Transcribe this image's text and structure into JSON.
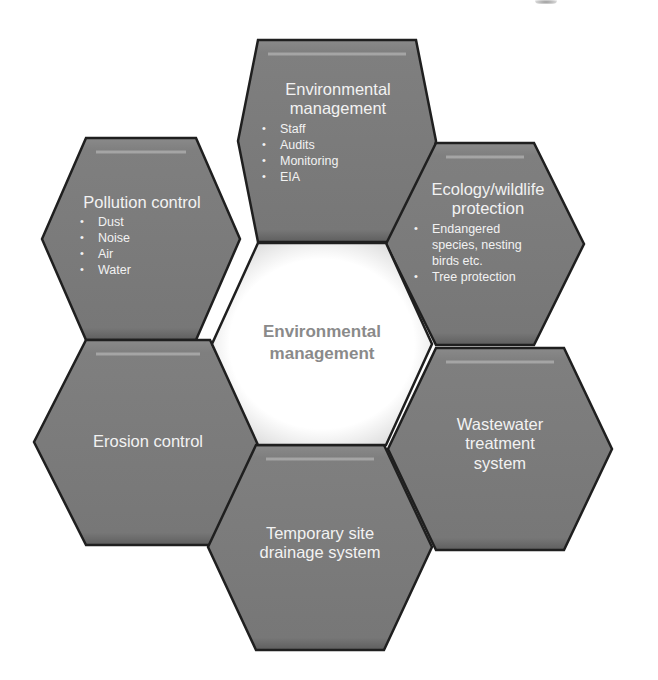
{
  "diagram": {
    "type": "hexagon-cluster",
    "colors": {
      "background": "#ffffff",
      "hex_fill": "#7d7d7d",
      "hex_border": "#1f1f1f",
      "hex_text": "#f2f2f2",
      "center_fill": "#ffffff",
      "center_text": "#8a8a8a"
    },
    "center": {
      "title_line1": "Environmental",
      "title_line2": "management"
    },
    "top": {
      "title_line1": "Environmental",
      "title_line2": "management",
      "items": [
        "Staff",
        "Audits",
        "Monitoring",
        "EIA"
      ]
    },
    "top_left": {
      "title": "Pollution control",
      "items": [
        "Dust",
        "Noise",
        "Air",
        "Water"
      ]
    },
    "top_right": {
      "title_line1": "Ecology/wildlife",
      "title_line2": "protection",
      "items": [
        "Endangered species, nesting birds etc.",
        "Tree protection"
      ]
    },
    "bottom_left": {
      "title": "Erosion control"
    },
    "bottom_right": {
      "title_line1": "Wastewater",
      "title_line2": "treatment",
      "title_line3": "system"
    },
    "bottom": {
      "title_line1": "Temporary site",
      "title_line2": "drainage system"
    }
  }
}
